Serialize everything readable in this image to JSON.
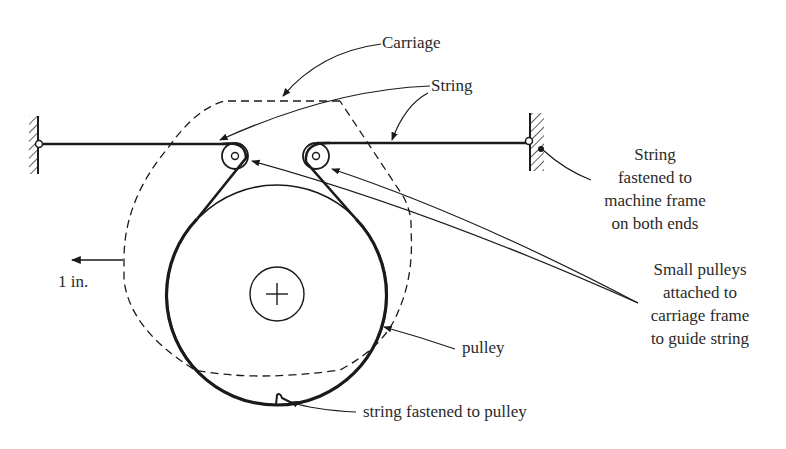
{
  "diagram": {
    "type": "mechanical schematic"
  },
  "labels": {
    "carriage": "Carriage",
    "string": "String",
    "fastened_frame": [
      "String",
      "fastened to",
      "machine frame",
      "on both ends"
    ],
    "small_pulleys": [
      "Small pulleys",
      "attached to",
      "carriage frame",
      "to guide string"
    ],
    "pulley": "pulley",
    "string_fastened_pulley": "string fastened to pulley",
    "displacement": "1 in."
  },
  "colors": {
    "line": "#1a1a1a",
    "text": "#2a2a2a",
    "background": "#ffffff"
  }
}
